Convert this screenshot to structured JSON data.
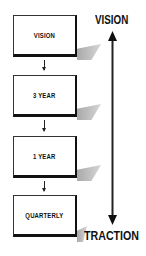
{
  "diagram": {
    "boxes": [
      {
        "label": "VISION"
      },
      {
        "label": "3 YEAR"
      },
      {
        "label": "1 YEAR"
      },
      {
        "label": "QUARTERLY"
      }
    ],
    "axis": {
      "top_label": "VISION",
      "bottom_label": "TRACTION",
      "direction": "bidirectional"
    },
    "colors": {
      "box_border": "#111111",
      "shadow": "#a9a9a9",
      "background": "#ffffff"
    }
  }
}
